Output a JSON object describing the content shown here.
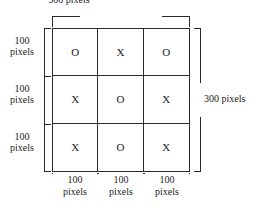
{
  "diagram": {
    "background_color": "#ffffff",
    "line_color": "#2b2b2b",
    "text_color": "#1a1a1a",
    "grid": {
      "rows": 3,
      "columns": 3,
      "cells": [
        [
          "O",
          "X",
          "O"
        ],
        [
          "X",
          "O",
          "X"
        ],
        [
          "X",
          "O",
          "X"
        ]
      ]
    },
    "top_measurement": {
      "value": "300",
      "unit": "pixels",
      "label": "300 pixels"
    },
    "right_measurement": {
      "value": "300",
      "unit": "pixels",
      "label": "300 pixels"
    },
    "left_measurements": [
      {
        "value": "100",
        "unit": "pixels"
      },
      {
        "value": "100",
        "unit": "pixels"
      },
      {
        "value": "100",
        "unit": "pixels"
      }
    ],
    "bottom_measurements": [
      {
        "value": "100",
        "unit": "pixels"
      },
      {
        "value": "100",
        "unit": "pixels"
      },
      {
        "value": "100",
        "unit": "pixels"
      }
    ]
  }
}
